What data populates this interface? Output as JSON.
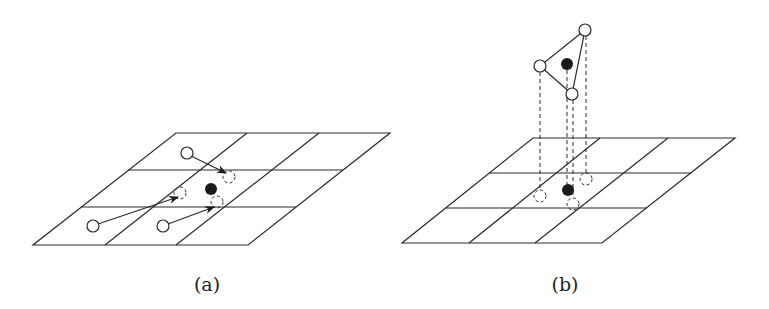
{
  "figure": {
    "panels": [
      {
        "id": "a",
        "caption": "(a)",
        "description": "Grid with source points (hollow circles) moved by arrows to new positions (dashed circles) around a target point (filled dot)"
      },
      {
        "id": "b",
        "caption": "(b)",
        "description": "Triangle of points above the grid projected down via dashed lines onto the grid plane; filled dot projected likewise"
      }
    ],
    "colors": {
      "line": "#2a2a2a",
      "filled_point": "#1a1a1a",
      "background": "#ffffff"
    }
  }
}
